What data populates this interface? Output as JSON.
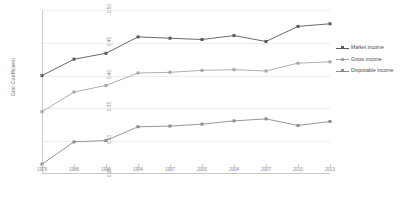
{
  "chart_data": {
    "type": "line",
    "title": "",
    "xlabel": "",
    "ylabel": "Gini Coefficient",
    "grid": true,
    "legend_position": "right",
    "ylim": [
      0.25,
      0.5
    ],
    "yticks": [
      "0.50",
      "0.45",
      "0.40",
      "0.35",
      "0.30",
      "0.25"
    ],
    "ytick_values": [
      0.5,
      0.45,
      0.4,
      0.35,
      0.3,
      0.25
    ],
    "categories": [
      "1979",
      "1986",
      "1991",
      "1994",
      "1997",
      "2000",
      "2004",
      "2007",
      "2010",
      "2013"
    ],
    "series": [
      {
        "name": "Market income",
        "color": "#595959",
        "marker": "square",
        "values": [
          0.4,
          0.425,
          0.434,
          0.459,
          0.457,
          0.455,
          0.461,
          0.452,
          0.475,
          0.479
        ]
      },
      {
        "name": "Gross income",
        "color": "#a6a6a6",
        "marker": "square",
        "values": [
          0.345,
          0.375,
          0.385,
          0.404,
          0.405,
          0.408,
          0.409,
          0.407,
          0.419,
          0.421
        ]
      },
      {
        "name": "Disposable income",
        "color": "#8c8c8c",
        "marker": "square",
        "values": [
          0.265,
          0.299,
          0.301,
          0.322,
          0.323,
          0.326,
          0.331,
          0.334,
          0.324,
          0.33
        ]
      }
    ]
  },
  "legend": {
    "items": [
      {
        "label": "Market income"
      },
      {
        "label": "Gross income"
      },
      {
        "label": "Disposable income"
      }
    ]
  }
}
